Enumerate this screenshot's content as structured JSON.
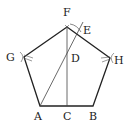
{
  "diagram": {
    "type": "geometric-construction",
    "shape": "regular-pentagon",
    "stroke_color": "#222222",
    "thin_stroke_color": "#444444",
    "points": {
      "F": {
        "label": "F",
        "x": 67,
        "y": 27
      },
      "H": {
        "label": "H",
        "x": 110,
        "y": 58
      },
      "B": {
        "label": "B",
        "x": 93,
        "y": 106
      },
      "A": {
        "label": "A",
        "x": 40,
        "y": 106
      },
      "G": {
        "label": "G",
        "x": 24,
        "y": 57
      },
      "C": {
        "label": "C",
        "x": 67,
        "y": 106
      },
      "D": {
        "label": "D",
        "x": 67,
        "y": 58
      },
      "E": {
        "label": "E",
        "x": 77,
        "y": 34
      }
    },
    "labels": {
      "F": "F",
      "E": "E",
      "G": "G",
      "D": "D",
      "H": "H",
      "A": "A",
      "C": "C",
      "B": "B"
    },
    "segments": [
      {
        "from": "F",
        "to": "C",
        "kind": "construction"
      },
      {
        "from": "A",
        "to": "E",
        "kind": "construction",
        "extended": true
      }
    ]
  }
}
